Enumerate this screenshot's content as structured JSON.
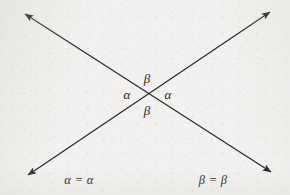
{
  "figure": {
    "background_color": "#f2f1ef",
    "ink_color": "#262626",
    "canvas": {
      "width": 290,
      "height": 195
    },
    "intersection": {
      "x": 148,
      "y": 93
    }
  },
  "lines": [
    {
      "name": "line-nw-se",
      "description": "double-headed arrow from upper-left to lower-right",
      "x1": 25,
      "y1": 14,
      "x2": 271,
      "y2": 172,
      "arrow_start": true,
      "arrow_end": true
    },
    {
      "name": "line-sw-ne",
      "description": "double-headed arrow from lower-left to upper-right",
      "x1": 28,
      "y1": 175,
      "x2": 270,
      "y2": 12,
      "arrow_start": true,
      "arrow_end": true
    }
  ],
  "angle_labels": [
    {
      "id": "beta-top",
      "text": "β",
      "x": 147,
      "y": 78
    },
    {
      "id": "alpha-left",
      "text": "α",
      "x": 127,
      "y": 94
    },
    {
      "id": "alpha-right",
      "text": "α",
      "x": 168,
      "y": 94
    },
    {
      "id": "beta-bottom",
      "text": "β",
      "x": 147,
      "y": 110
    }
  ],
  "identities": [
    {
      "id": "alpha-identity",
      "text": "α = α",
      "x": 79,
      "y": 180
    },
    {
      "id": "beta-identity",
      "text": "β = β",
      "x": 213,
      "y": 180
    }
  ]
}
